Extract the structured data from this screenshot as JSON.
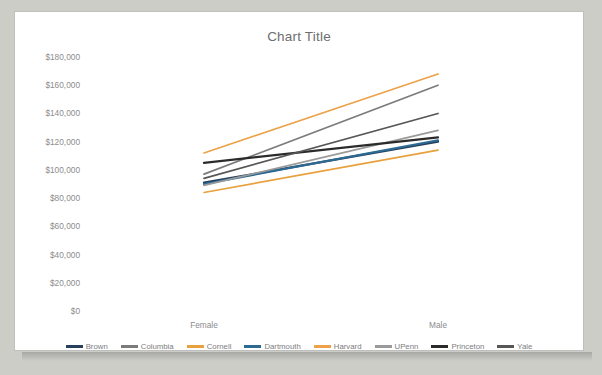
{
  "chart_data": {
    "type": "line",
    "title": "Chart Title",
    "xlabel": "",
    "ylabel": "",
    "categories": [
      "Female",
      "Male"
    ],
    "x_tick_labels": [
      "Female",
      "Male"
    ],
    "y_tick_labels": [
      "$0",
      "$20,000",
      "$40,000",
      "$60,000",
      "$80,000",
      "$100,000",
      "$120,000",
      "$140,000",
      "$160,000",
      "$180,000"
    ],
    "y_tick_values": [
      0,
      20000,
      40000,
      60000,
      80000,
      100000,
      120000,
      140000,
      160000,
      180000
    ],
    "ylim": [
      0,
      180000
    ],
    "grid": false,
    "legend_position": "bottom",
    "series": [
      {
        "name": "Brown",
        "color": "#27405e",
        "values": [
          91000,
          120000
        ]
      },
      {
        "name": "Columbia",
        "color": "#7b7b7b",
        "values": [
          97000,
          160000
        ]
      },
      {
        "name": "Cornell",
        "color": "#e8a13c",
        "values": [
          84000,
          114000
        ]
      },
      {
        "name": "Dartmouth",
        "color": "#2d6a93",
        "values": [
          90000,
          121000
        ]
      },
      {
        "name": "Harvard",
        "color": "#eda24a",
        "values": [
          112000,
          168000
        ]
      },
      {
        "name": "UPenn",
        "color": "#9a9a9a",
        "values": [
          89000,
          128000
        ]
      },
      {
        "name": "Princeton",
        "color": "#2b2b2b",
        "values": [
          105000,
          123000
        ]
      },
      {
        "name": "Yale",
        "color": "#575757",
        "values": [
          94000,
          140000
        ]
      }
    ]
  },
  "legend": {
    "items": [
      {
        "label": "Brown"
      },
      {
        "label": "Columbia"
      },
      {
        "label": "Cornell"
      },
      {
        "label": "Dartmouth"
      },
      {
        "label": "Harvard"
      },
      {
        "label": "UPenn"
      },
      {
        "label": "Princeton"
      },
      {
        "label": "Yale"
      }
    ]
  },
  "colors": {
    "card_background": "#ffffff",
    "card_border": "#bfbfbf",
    "page_background": "#cdcdc8",
    "axis_text": "#8c8c8c",
    "title_text": "#6e6e6e"
  }
}
